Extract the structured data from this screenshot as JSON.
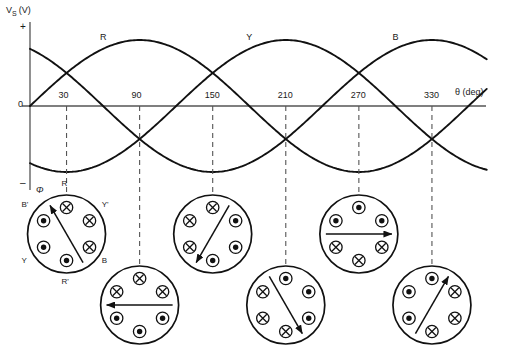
{
  "figure": {
    "type": "waveform-with-rotating-field-diagram",
    "axes": {
      "y_axis_label": "Vₛ (V)",
      "y_axis_label_main": "V",
      "y_axis_label_sub": "S",
      "y_axis_label_unit": "(V)",
      "x_axis_label": "θ (deg)",
      "origin_label": "0",
      "positive_sign": "+",
      "negative_sign": "–",
      "flux_symbol": "Φ"
    },
    "tick_labels": [
      "30",
      "90",
      "150",
      "210",
      "270",
      "330"
    ],
    "tick_degrees": [
      30,
      90,
      150,
      210,
      270,
      330
    ],
    "curve_labels": [
      {
        "name": "R",
        "x_deg": 60
      },
      {
        "name": "Y",
        "x_deg": 180
      },
      {
        "name": "B",
        "x_deg": 300
      }
    ],
    "colors": {
      "curve": "#111111",
      "axis": "#555555",
      "dashed": "#555555",
      "text": "#1a1a1a",
      "background": "#ffffff"
    }
  },
  "chart_data": {
    "type": "line",
    "title": "",
    "xlabel": "θ (deg)",
    "ylabel": "Vₛ (V)",
    "xlim": [
      0,
      375
    ],
    "ylim": [
      -1,
      1
    ],
    "grid": false,
    "legend": "inline-curve-labels",
    "x_ticks": [
      30,
      90,
      150,
      210,
      270,
      330
    ],
    "series": [
      {
        "name": "R",
        "phase_deg": 0,
        "amplitude": 1,
        "label_at_deg": 60
      },
      {
        "name": "Y",
        "phase_deg": 240,
        "amplitude": 1,
        "label_at_deg": 180
      },
      {
        "name": "B",
        "phase_deg": 120,
        "amplitude": 1,
        "label_at_deg": 300
      }
    ]
  },
  "stator_diagrams": [
    {
      "id": "stator-30",
      "angle_deg": 30,
      "row": "upper",
      "arrow_direction_deg": 120,
      "pole_labels": [
        {
          "text": "R",
          "position": "top"
        },
        {
          "text": "Y'",
          "position": "top-right"
        },
        {
          "text": "B",
          "position": "bottom-right"
        },
        {
          "text": "R'",
          "position": "bottom"
        },
        {
          "text": "Y",
          "position": "bottom-left"
        },
        {
          "text": "B'",
          "position": "top-left"
        }
      ],
      "slots": [
        {
          "position": "top",
          "symbol": "cross"
        },
        {
          "position": "top-right",
          "symbol": "cross"
        },
        {
          "position": "bottom-right",
          "symbol": "cross"
        },
        {
          "position": "bottom",
          "symbol": "dot"
        },
        {
          "position": "bottom-left",
          "symbol": "dot"
        },
        {
          "position": "top-left",
          "symbol": "dot"
        }
      ]
    },
    {
      "id": "stator-90",
      "angle_deg": 90,
      "row": "lower",
      "arrow_direction_deg": 180,
      "pole_labels": [],
      "slots": [
        {
          "position": "top",
          "symbol": "cross"
        },
        {
          "position": "top-right",
          "symbol": "cross"
        },
        {
          "position": "bottom-right",
          "symbol": "dot"
        },
        {
          "position": "bottom",
          "symbol": "dot"
        },
        {
          "position": "bottom-left",
          "symbol": "dot"
        },
        {
          "position": "top-left",
          "symbol": "cross"
        }
      ]
    },
    {
      "id": "stator-150",
      "angle_deg": 150,
      "row": "upper",
      "arrow_direction_deg": 240,
      "pole_labels": [],
      "slots": [
        {
          "position": "top",
          "symbol": "cross"
        },
        {
          "position": "top-right",
          "symbol": "dot"
        },
        {
          "position": "bottom-right",
          "symbol": "dot"
        },
        {
          "position": "bottom",
          "symbol": "dot"
        },
        {
          "position": "bottom-left",
          "symbol": "cross"
        },
        {
          "position": "top-left",
          "symbol": "cross"
        }
      ]
    },
    {
      "id": "stator-210",
      "angle_deg": 210,
      "row": "lower",
      "arrow_direction_deg": 300,
      "pole_labels": [],
      "slots": [
        {
          "position": "top",
          "symbol": "dot"
        },
        {
          "position": "top-right",
          "symbol": "dot"
        },
        {
          "position": "bottom-right",
          "symbol": "dot"
        },
        {
          "position": "bottom",
          "symbol": "cross"
        },
        {
          "position": "bottom-left",
          "symbol": "cross"
        },
        {
          "position": "top-left",
          "symbol": "cross"
        }
      ]
    },
    {
      "id": "stator-270",
      "angle_deg": 270,
      "row": "upper",
      "arrow_direction_deg": 0,
      "pole_labels": [],
      "slots": [
        {
          "position": "top",
          "symbol": "dot"
        },
        {
          "position": "top-right",
          "symbol": "dot"
        },
        {
          "position": "bottom-right",
          "symbol": "cross"
        },
        {
          "position": "bottom",
          "symbol": "cross"
        },
        {
          "position": "bottom-left",
          "symbol": "cross"
        },
        {
          "position": "top-left",
          "symbol": "dot"
        }
      ]
    },
    {
      "id": "stator-330",
      "angle_deg": 330,
      "row": "lower",
      "arrow_direction_deg": 60,
      "pole_labels": [],
      "slots": [
        {
          "position": "top",
          "symbol": "dot"
        },
        {
          "position": "top-right",
          "symbol": "cross"
        },
        {
          "position": "bottom-right",
          "symbol": "cross"
        },
        {
          "position": "bottom",
          "symbol": "cross"
        },
        {
          "position": "bottom-left",
          "symbol": "dot"
        },
        {
          "position": "top-left",
          "symbol": "dot"
        }
      ]
    }
  ]
}
